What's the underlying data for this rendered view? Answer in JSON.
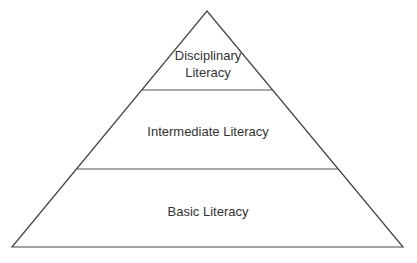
{
  "diagram": {
    "type": "pyramid",
    "line_color": "#444444",
    "text_color": "#333333",
    "levels": [
      {
        "line1": "Disciplinary",
        "line2": "Literacy"
      },
      {
        "label": "Intermediate Literacy"
      },
      {
        "label": "Basic Literacy"
      }
    ]
  }
}
